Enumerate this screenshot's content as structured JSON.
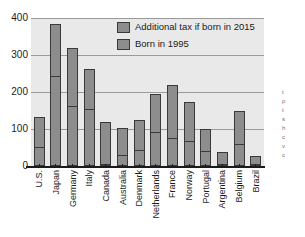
{
  "chart_data": {
    "type": "bar",
    "subtype": "stacked",
    "title": "",
    "xlabel": "",
    "ylabel": "",
    "ylim": [
      0,
      400
    ],
    "yticks": [
      0,
      100,
      200,
      300,
      400
    ],
    "grid": true,
    "legend_position": "inside-top-center",
    "categories": [
      "U.S.",
      "Japan",
      "Germany",
      "Italy",
      "Canada",
      "Australia",
      "Denmark",
      "Netherlands",
      "France",
      "Norway",
      "Portugal",
      "Argentina",
      "Belgium",
      "Brazil"
    ],
    "series": [
      {
        "name": "Born in 1995",
        "values": [
          84,
          142,
          160,
          111,
          120,
          76,
          83,
          107,
          145,
          107,
          63,
          37,
          91,
          28
        ]
      },
      {
        "name": "Additional tax if born in 2015",
        "values": [
          49,
          241,
          159,
          151,
          0,
          28,
          41,
          88,
          73,
          66,
          37,
          0,
          57,
          0
        ]
      }
    ],
    "totals": [
      133,
      383,
      319,
      262,
      120,
      104,
      124,
      195,
      218,
      173,
      100,
      37,
      148,
      28
    ]
  },
  "axis": {
    "y_ticks": [
      "400",
      "300",
      "200",
      "100",
      "0"
    ]
  },
  "legend": {
    "items": [
      {
        "label": "Additional tax if born in 2015"
      },
      {
        "label": "Born in 1995"
      }
    ]
  },
  "margin_note": {
    "lines": [
      "t",
      "p",
      "t",
      "s",
      "h",
      "c",
      "v",
      "c"
    ]
  },
  "colors": {
    "bar_fill": "#8d8d8d",
    "bar_border": "#3a3a3a",
    "plot_background": "#e9e9e9",
    "gridline": "#9a9a9a",
    "axis": "#1b1b1b",
    "page_background": "#ffffff"
  }
}
